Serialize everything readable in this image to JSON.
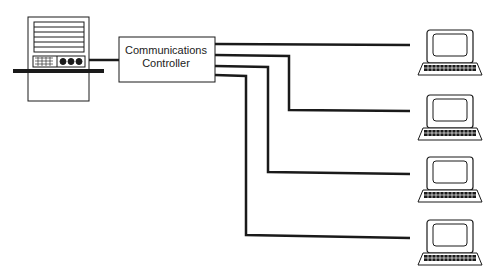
{
  "diagram": {
    "controller": {
      "line1": "Communications",
      "line2": "Controller"
    },
    "host": {
      "icon": "mainframe-computer-icon"
    },
    "terminals": [
      {
        "icon": "terminal-icon",
        "index": 1
      },
      {
        "icon": "terminal-icon",
        "index": 2
      },
      {
        "icon": "terminal-icon",
        "index": 3
      },
      {
        "icon": "terminal-icon",
        "index": 4
      }
    ],
    "colors": {
      "line": "#1a1a1a",
      "background": "#ffffff"
    }
  }
}
